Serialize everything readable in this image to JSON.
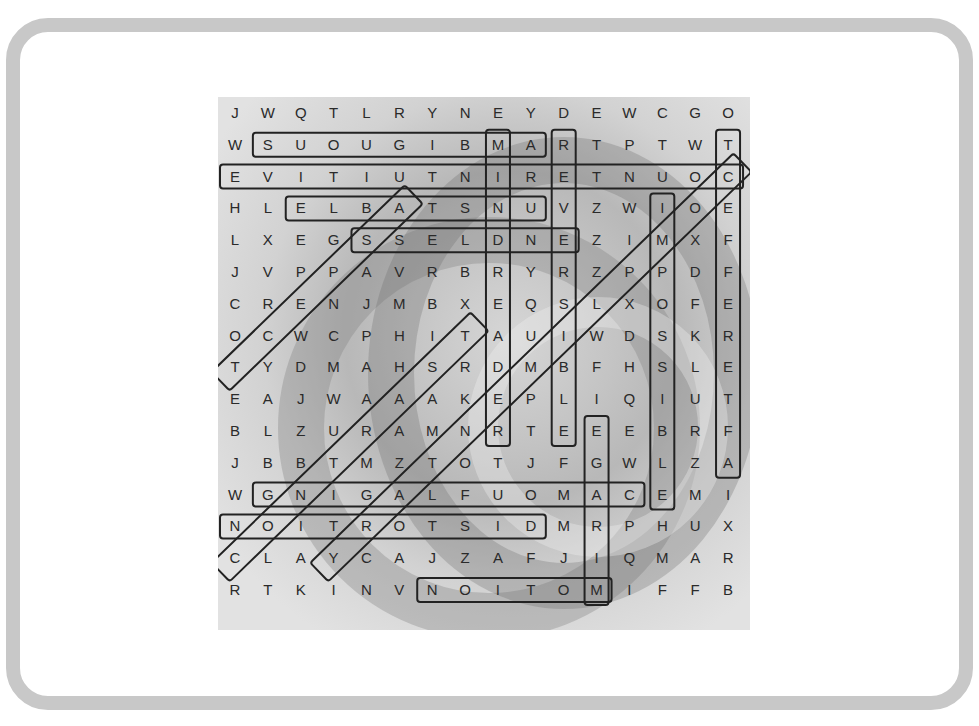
{
  "puzzle": {
    "type": "word-search",
    "rows": 16,
    "cols": 16,
    "grid": [
      [
        "J",
        "W",
        "Q",
        "T",
        "L",
        "R",
        "Y",
        "N",
        "E",
        "Y",
        "D",
        "E",
        "W",
        "C",
        "G",
        "O"
      ],
      [
        "W",
        "S",
        "U",
        "O",
        "U",
        "G",
        "I",
        "B",
        "M",
        "A",
        "R",
        "T",
        "P",
        "T",
        "W",
        "T"
      ],
      [
        "E",
        "V",
        "I",
        "T",
        "I",
        "U",
        "T",
        "N",
        "I",
        "R",
        "E",
        "T",
        "N",
        "U",
        "O",
        "C"
      ],
      [
        "H",
        "L",
        "E",
        "L",
        "B",
        "A",
        "T",
        "S",
        "N",
        "U",
        "V",
        "Z",
        "W",
        "I",
        "O",
        "E"
      ],
      [
        "L",
        "X",
        "E",
        "G",
        "S",
        "S",
        "E",
        "L",
        "D",
        "N",
        "E",
        "Z",
        "I",
        "M",
        "X",
        "F"
      ],
      [
        "J",
        "V",
        "P",
        "P",
        "A",
        "V",
        "R",
        "B",
        "R",
        "Y",
        "R",
        "Z",
        "P",
        "P",
        "D",
        "F"
      ],
      [
        "C",
        "R",
        "E",
        "N",
        "J",
        "M",
        "B",
        "X",
        "E",
        "Q",
        "S",
        "L",
        "X",
        "O",
        "F",
        "E"
      ],
      [
        "O",
        "C",
        "W",
        "C",
        "P",
        "H",
        "I",
        "T",
        "A",
        "U",
        "I",
        "W",
        "D",
        "S",
        "K",
        "R"
      ],
      [
        "T",
        "Y",
        "D",
        "M",
        "A",
        "H",
        "S",
        "R",
        "D",
        "M",
        "B",
        "F",
        "H",
        "S",
        "L",
        "E"
      ],
      [
        "E",
        "A",
        "J",
        "W",
        "A",
        "A",
        "A",
        "K",
        "E",
        "P",
        "L",
        "I",
        "Q",
        "I",
        "U",
        "T"
      ],
      [
        "B",
        "L",
        "Z",
        "U",
        "R",
        "A",
        "M",
        "N",
        "R",
        "T",
        "E",
        "E",
        "E",
        "B",
        "R",
        "F"
      ],
      [
        "J",
        "B",
        "B",
        "T",
        "M",
        "Z",
        "T",
        "O",
        "T",
        "J",
        "F",
        "G",
        "W",
        "L",
        "Z",
        "A"
      ],
      [
        "W",
        "G",
        "N",
        "I",
        "G",
        "A",
        "L",
        "F",
        "U",
        "O",
        "M",
        "A",
        "C",
        "E",
        "M",
        "I"
      ],
      [
        "N",
        "O",
        "I",
        "T",
        "R",
        "O",
        "T",
        "S",
        "I",
        "D",
        "M",
        "R",
        "P",
        "H",
        "U",
        "X"
      ],
      [
        "C",
        "L",
        "A",
        "Y",
        "C",
        "A",
        "J",
        "Z",
        "A",
        "F",
        "J",
        "I",
        "Q",
        "M",
        "A",
        "R"
      ],
      [
        "R",
        "T",
        "K",
        "I",
        "N",
        "V",
        "N",
        "O",
        "I",
        "T",
        "O",
        "M",
        "I",
        "F",
        "F",
        "B"
      ]
    ],
    "found_words": [
      {
        "word": "AMBIGUOUS",
        "start": [
          1,
          9
        ],
        "end": [
          1,
          1
        ],
        "direction": "horizontal"
      },
      {
        "word": "COUNTERINTUITIVE",
        "start": [
          2,
          15
        ],
        "end": [
          2,
          0
        ],
        "direction": "horizontal"
      },
      {
        "word": "UNSTABLE",
        "start": [
          3,
          9
        ],
        "end": [
          3,
          2
        ],
        "direction": "horizontal"
      },
      {
        "word": "ENDLESS",
        "start": [
          4,
          10
        ],
        "end": [
          4,
          4
        ],
        "direction": "horizontal"
      },
      {
        "word": "CAMOUFLAGING",
        "start": [
          12,
          12
        ],
        "end": [
          12,
          1
        ],
        "direction": "horizontal"
      },
      {
        "word": "DISTORTION",
        "start": [
          13,
          9
        ],
        "end": [
          13,
          0
        ],
        "direction": "horizontal"
      },
      {
        "word": "MOTION",
        "start": [
          15,
          11
        ],
        "end": [
          15,
          6
        ],
        "direction": "horizontal"
      },
      {
        "word": "MINDREADER",
        "start": [
          1,
          8
        ],
        "end": [
          10,
          8
        ],
        "direction": "vertical"
      },
      {
        "word": "REVERSIBLE",
        "start": [
          1,
          10
        ],
        "end": [
          10,
          10
        ],
        "direction": "vertical"
      },
      {
        "word": "AFTEREFFECT",
        "start": [
          11,
          15
        ],
        "end": [
          1,
          15
        ],
        "direction": "vertical"
      },
      {
        "word": "IMPOSSIBLE",
        "start": [
          3,
          13
        ],
        "end": [
          12,
          13
        ],
        "direction": "vertical"
      },
      {
        "word": "MIRAGE",
        "start": [
          15,
          11
        ],
        "end": [
          10,
          11
        ],
        "direction": "vertical"
      },
      {
        "word": "ASPECT",
        "start": [
          3,
          5
        ],
        "end": [
          8,
          0
        ],
        "direction": "diagonal"
      },
      {
        "word": "CONTRAST",
        "start": [
          14,
          0
        ],
        "end": [
          7,
          7
        ],
        "direction": "diagonal"
      },
      {
        "word": "COMPLIMENTARY",
        "start": [
          2,
          15
        ],
        "end": [
          14,
          3
        ],
        "direction": "diagonal"
      }
    ]
  },
  "colors": {
    "frame": "#c8c8c8",
    "background": "#ffffff",
    "letters": "#2a2a2a",
    "outline": "#222222"
  }
}
